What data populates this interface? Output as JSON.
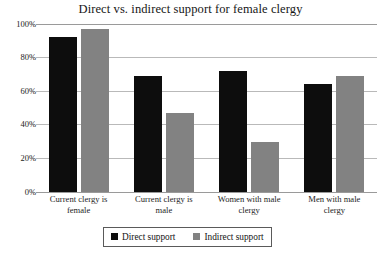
{
  "chart_data": {
    "type": "bar",
    "title": "Direct vs. indirect support for female clergy",
    "xlabel": "",
    "ylabel": "",
    "ylim": [
      0,
      100
    ],
    "yticks": [
      "0%",
      "20%",
      "40%",
      "60%",
      "80%",
      "100%"
    ],
    "ytick_values": [
      0,
      20,
      40,
      60,
      80,
      100
    ],
    "grid": true,
    "legend_position": "bottom-center",
    "categories": [
      "Current clergy is female",
      "Current clergy is male",
      "Women with male clergy",
      "Men with male clergy"
    ],
    "category_lines": [
      [
        "Current clergy is",
        "female"
      ],
      [
        "Current clergy is",
        "male"
      ],
      [
        "Women with male",
        "clergy"
      ],
      [
        "Men with male",
        "clergy"
      ]
    ],
    "series": [
      {
        "name": "Direct support",
        "color": "#0d0d0d",
        "values": [
          92,
          69,
          72,
          64
        ]
      },
      {
        "name": "Indirect support",
        "color": "#828282",
        "values": [
          97,
          47,
          30,
          69
        ]
      }
    ]
  },
  "colors": {
    "direct": "#0d0d0d",
    "indirect": "#828282",
    "gridline": "#b9b9b9",
    "axis": "#9a9a9a",
    "background": "#ffffff",
    "text": "#1a1a1a"
  }
}
